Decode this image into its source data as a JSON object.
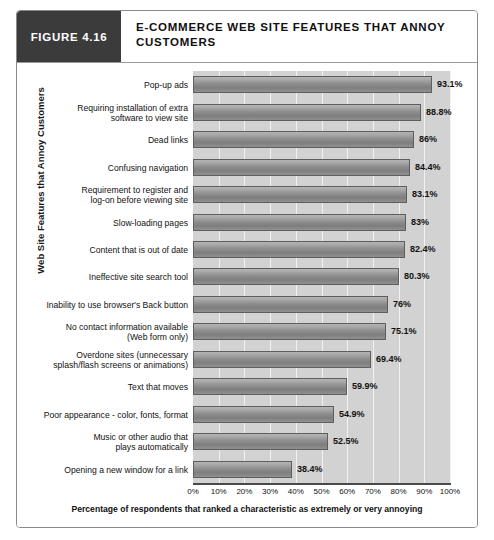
{
  "figure": {
    "badge": "FIGURE 4.16",
    "title": "E-COMMERCE WEB SITE FEATURES THAT ANNOY CUSTOMERS"
  },
  "chart_data": {
    "type": "bar",
    "orientation": "horizontal",
    "title": "E-COMMERCE WEB SITE FEATURES THAT ANNOY CUSTOMERS",
    "xlabel": "Percentage of respondents that ranked a characteristic as extremely or very annoying",
    "ylabel": "Web Site Features that Annoy Customers",
    "xlim": [
      0,
      100
    ],
    "xticks": [
      "0%",
      "10%",
      "20%",
      "30%",
      "40%",
      "50%",
      "60%",
      "70%",
      "80%",
      "90%",
      "100%"
    ],
    "grid": true,
    "legend": "none",
    "bar_color": "#8e8e8e",
    "plot_background": "#d2d2d2",
    "categories": [
      "Pop-up ads",
      "Requiring installation of extra software to view site",
      "Dead links",
      "Confusing navigation",
      "Requirement to register and log-on before viewing site",
      "Slow-loading pages",
      "Content that is out of date",
      "Ineffective site search tool",
      "Inability to use browser's Back button",
      "No contact information available (Web form only)",
      "Overdone sites (unnecessary splash/flash screens or animations)",
      "Text that moves",
      "Poor appearance - color, fonts, format",
      "Music or other audio that plays automatically",
      "Opening a new window for a link"
    ],
    "category_lines": [
      [
        "Pop-up ads"
      ],
      [
        "Requiring installation of extra",
        "software to view site"
      ],
      [
        "Dead links"
      ],
      [
        "Confusing navigation"
      ],
      [
        "Requirement to register and",
        "log-on before viewing site"
      ],
      [
        "Slow-loading pages"
      ],
      [
        "Content that is out of date"
      ],
      [
        "Ineffective site search tool"
      ],
      [
        "Inability to use browser's Back button"
      ],
      [
        "No contact information available",
        "(Web form only)"
      ],
      [
        "Overdone sites (unnecessary",
        "splash/flash screens or animations)"
      ],
      [
        "Text that moves"
      ],
      [
        "Poor appearance - color, fonts, format"
      ],
      [
        "Music or other audio that",
        "plays automatically"
      ],
      [
        "Opening a new window for a link"
      ]
    ],
    "values": [
      93.1,
      88.8,
      86,
      84.4,
      83.1,
      83,
      82.4,
      80.3,
      76,
      75.1,
      69.4,
      59.9,
      54.9,
      52.5,
      38.4
    ],
    "value_labels": [
      "93.1%",
      "88.8%",
      "86%",
      "84.4%",
      "83.1%",
      "83%",
      "82.4%",
      "80.3%",
      "76%",
      "75.1%",
      "69.4%",
      "59.9%",
      "54.9%",
      "52.5%",
      "38.4%"
    ]
  }
}
